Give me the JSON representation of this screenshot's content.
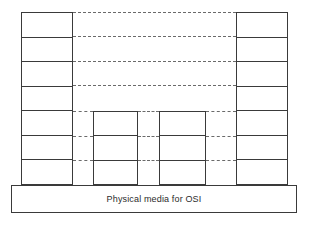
{
  "diagram": {
    "canvas": {
      "width": 311,
      "height": 226,
      "background": "#ffffff"
    },
    "colors": {
      "solid_line": "#3a3a3a",
      "dashed_line": "#6a6a6a",
      "fill": "#ffffff",
      "text": "#2b2b2b"
    },
    "base_bar": {
      "label": "Physical media for OSI",
      "x": 11,
      "y": 185,
      "width": 286,
      "height": 28
    },
    "stacks": [
      {
        "name": "left-end-system",
        "kind": "end-system",
        "x": 21,
        "y": 12,
        "width": 52,
        "height": 173,
        "layer_count": 7,
        "layers": [
          {
            "index": 7,
            "label": ""
          },
          {
            "index": 6,
            "label": ""
          },
          {
            "index": 5,
            "label": ""
          },
          {
            "index": 4,
            "label": ""
          },
          {
            "index": 3,
            "label": ""
          },
          {
            "index": 2,
            "label": ""
          },
          {
            "index": 1,
            "label": ""
          }
        ]
      },
      {
        "name": "left-intermediate-system",
        "kind": "intermediate-system",
        "x": 93,
        "y": 111,
        "width": 45,
        "height": 74,
        "layer_count": 3,
        "layers": [
          {
            "index": 3,
            "label": ""
          },
          {
            "index": 2,
            "label": ""
          },
          {
            "index": 1,
            "label": ""
          }
        ]
      },
      {
        "name": "right-intermediate-system",
        "kind": "intermediate-system",
        "x": 159,
        "y": 111,
        "width": 47,
        "height": 74,
        "layer_count": 3,
        "layers": [
          {
            "index": 3,
            "label": ""
          },
          {
            "index": 2,
            "label": ""
          },
          {
            "index": 1,
            "label": ""
          }
        ]
      },
      {
        "name": "right-end-system",
        "kind": "end-system",
        "x": 236,
        "y": 12,
        "width": 52,
        "height": 173,
        "layer_count": 7,
        "layers": [
          {
            "index": 7,
            "label": ""
          },
          {
            "index": 6,
            "label": ""
          },
          {
            "index": 5,
            "label": ""
          },
          {
            "index": 4,
            "label": ""
          },
          {
            "index": 3,
            "label": ""
          },
          {
            "index": 2,
            "label": ""
          },
          {
            "index": 1,
            "label": ""
          }
        ]
      }
    ],
    "connectors": [
      {
        "name": "peer-link-layer-7",
        "x": 73,
        "y": 12,
        "width": 163
      },
      {
        "name": "peer-link-layer-6",
        "x": 73,
        "y": 36,
        "width": 163
      },
      {
        "name": "peer-link-layer-5",
        "x": 73,
        "y": 61,
        "width": 163
      },
      {
        "name": "peer-link-layer-4",
        "x": 73,
        "y": 85,
        "width": 163
      },
      {
        "name": "peer-link-layer-3-seg-a",
        "x": 73,
        "y": 111,
        "width": 20
      },
      {
        "name": "peer-link-layer-3-seg-b",
        "x": 138,
        "y": 111,
        "width": 21
      },
      {
        "name": "peer-link-layer-3-seg-c",
        "x": 206,
        "y": 111,
        "width": 30
      },
      {
        "name": "peer-link-layer-2-seg-a",
        "x": 73,
        "y": 136,
        "width": 20
      },
      {
        "name": "peer-link-layer-2-seg-b",
        "x": 138,
        "y": 136,
        "width": 21
      },
      {
        "name": "peer-link-layer-2-seg-c",
        "x": 206,
        "y": 136,
        "width": 30
      },
      {
        "name": "peer-link-layer-1-seg-a",
        "x": 73,
        "y": 160,
        "width": 20
      },
      {
        "name": "peer-link-layer-1-seg-b",
        "x": 138,
        "y": 160,
        "width": 21
      },
      {
        "name": "peer-link-layer-1-seg-c",
        "x": 206,
        "y": 160,
        "width": 30
      }
    ]
  }
}
